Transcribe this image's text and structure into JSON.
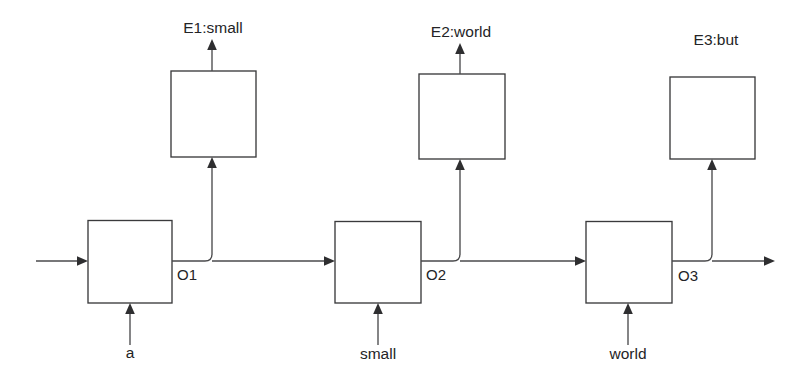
{
  "diagram": {
    "type": "unrolled-recurrent-network",
    "background_color": "#ffffff",
    "line_color": "#4a4a4c",
    "text_color": "#242426",
    "emit_labels": {
      "e1": "E1:small",
      "e2": "E2:world",
      "e3": "E3:but"
    },
    "state_labels": {
      "o1": "O1",
      "o2": "O2",
      "o3": "O3"
    },
    "input_labels": {
      "x1": "a",
      "x2": "small",
      "x3": "world"
    }
  }
}
